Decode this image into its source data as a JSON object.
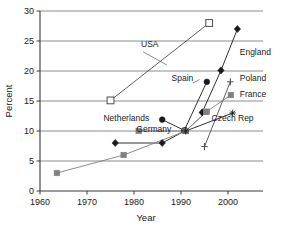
{
  "chart_data": {
    "type": "line",
    "title": "",
    "xlabel": "Year",
    "ylabel": "Percent",
    "xlim": [
      1960,
      2005
    ],
    "ylim": [
      0,
      30
    ],
    "xticks": [
      1960,
      1970,
      1980,
      1990,
      2000
    ],
    "xtick_labels": [
      "1960",
      "1970",
      "1980",
      "1990",
      "2000"
    ],
    "yticks": [
      0,
      5,
      10,
      15,
      20,
      25,
      30
    ],
    "ytick_labels": [
      "0",
      "5",
      "10",
      "15",
      "20",
      "25",
      "30"
    ],
    "grid": "horizontal",
    "legend": "inline-annotations",
    "series": [
      {
        "name": "USA",
        "marker": "open-square",
        "color": "#4d4d4d",
        "points": [
          [
            1975,
            15.1
          ],
          [
            1996,
            28.0
          ]
        ],
        "label_x": 1981.5,
        "label_y": 24.0
      },
      {
        "name": "England",
        "marker": "filled-diamond",
        "color": "#1a1a1a",
        "points": [
          [
            1994.5,
            13.1
          ],
          [
            1998.5,
            20.1
          ],
          [
            2002,
            27.0
          ]
        ],
        "label_x": 2002.5,
        "label_y": 22.7
      },
      {
        "name": "Spain",
        "marker": "filled-circle",
        "color": "#1a1a1a",
        "points": [
          [
            1986,
            11.9
          ],
          [
            1990.7,
            10.1
          ],
          [
            1995.5,
            18.2
          ]
        ],
        "label_x": 1988.0,
        "label_y": 18.4
      },
      {
        "name": "Poland",
        "marker": "plus",
        "color": "#4d4d4d",
        "points": [
          [
            1995.0,
            7.4
          ],
          [
            2000.5,
            18.2
          ]
        ],
        "label_x": 2002.5,
        "label_y": 18.3
      },
      {
        "name": "France",
        "marker": "filled-square",
        "color": "#808080",
        "points": [
          [
            1981,
            10.0
          ],
          [
            1991,
            10.0
          ],
          [
            1995.4,
            13.2
          ],
          [
            2000.6,
            16.0
          ]
        ],
        "label_x": 2002.5,
        "label_y": 15.6
      },
      {
        "name": "Netherlands",
        "marker": "filled-diamond",
        "color": "#1a1a1a",
        "points": [
          [
            1976,
            8.0
          ],
          [
            1986,
            8.0
          ],
          [
            1991,
            10.1
          ]
        ],
        "label_x": 1973.5,
        "label_y": 11.6
      },
      {
        "name": "Germany",
        "marker": "filled-square",
        "color": "#808080",
        "points": [
          [
            1963.6,
            3.0
          ],
          [
            1977.8,
            6.0
          ],
          [
            1991,
            10.0
          ],
          [
            1995.4,
            13.2
          ]
        ],
        "label_x": 1980.5,
        "label_y": 9.9
      },
      {
        "name": "Czech Rep",
        "marker": "star",
        "color": "#1a1a1a",
        "points": [
          [
            1991,
            10.0
          ],
          [
            2001,
            13.0
          ]
        ],
        "label_x": 1996.5,
        "label_y": 11.7
      }
    ]
  }
}
